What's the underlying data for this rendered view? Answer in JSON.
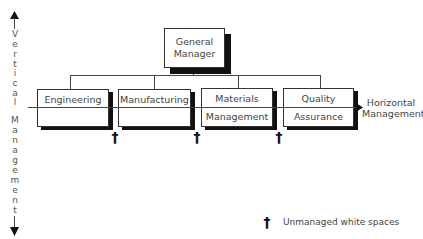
{
  "diagram": {
    "top_node": {
      "line1": "General",
      "line2": "Manager"
    },
    "departments": [
      {
        "line1": "Engineering",
        "line2": ""
      },
      {
        "line1": "Manufacturing",
        "line2": ""
      },
      {
        "line1": "Materials",
        "line2": "Management"
      },
      {
        "line1": "Quality",
        "line2": "Assurance"
      }
    ],
    "vertical_axis": {
      "label": "Vertical Management",
      "letters_top": [
        "V",
        "e",
        "r",
        "t",
        "i",
        "c",
        "a",
        "l"
      ],
      "letters_bottom": [
        "M",
        "a",
        "n",
        "a",
        "g",
        "e",
        "m",
        "e",
        "n",
        "t"
      ]
    },
    "horizontal_axis": {
      "line1": "Horizontal",
      "line2": "Management"
    },
    "gap_marker": {
      "symbol": "†",
      "count": 3
    },
    "legend": {
      "symbol": "†",
      "text": "Unmanaged white spaces"
    }
  },
  "colors": {
    "lines": "#444444",
    "shadow": "#111111",
    "text": "#444444",
    "background": "#ffffff"
  }
}
